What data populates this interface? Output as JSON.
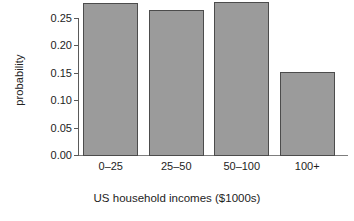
{
  "chart_data": {
    "type": "bar",
    "title": "",
    "subtitle": "",
    "xlabel": "US household incomes ($1000s)",
    "ylabel": "probability",
    "categories": [
      "0–25",
      "25–50",
      "50–100",
      "100+"
    ],
    "values": [
      0.277,
      0.265,
      0.28,
      0.152
    ],
    "ylim": [
      0.0,
      0.29
    ],
    "yticks": [
      0.0,
      0.05,
      0.1,
      0.15,
      0.2,
      0.25
    ],
    "ytick_labels": [
      "0.00",
      "0.05",
      "0.10",
      "0.15",
      "0.20",
      "0.25"
    ],
    "xtick_labels": [
      "0–25",
      "25–50",
      "50–100",
      "100+"
    ],
    "grid": false,
    "legend": null,
    "legend_position": "none",
    "annotations": [],
    "series": [
      {
        "name": "probability",
        "values": [
          0.277,
          0.265,
          0.28,
          0.152
        ]
      }
    ],
    "colors": {
      "bar_fill": "#9b9b9b",
      "bar_edge": "#4c4c4c",
      "axis": "#5a5a5a",
      "text": "#1d1d1d",
      "background": "#ffffff"
    }
  }
}
